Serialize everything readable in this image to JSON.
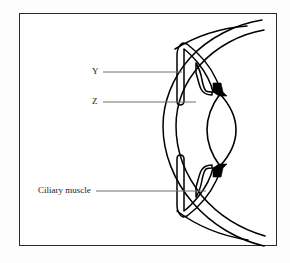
{
  "figure": {
    "type": "anatomical-diagram",
    "border_color": "#2a2a2a",
    "line_color": "#000000",
    "fill_color": "#000000",
    "background_color": "#ffffff"
  },
  "labels": {
    "y": "Y",
    "z": "Z",
    "ciliary_muscle": "Ciliary muscle"
  },
  "leader_lines": {
    "y": {
      "x1": 103,
      "y1": 72,
      "x2": 182,
      "y2": 72
    },
    "z": {
      "x1": 103,
      "y1": 102,
      "x2": 196,
      "y2": 102
    },
    "ciliary_muscle": {
      "x1": 96,
      "y1": 191,
      "x2": 206,
      "y2": 191
    }
  },
  "structures": [
    {
      "name": "sclera-outer-curve"
    },
    {
      "name": "sclera-inner-curve"
    },
    {
      "name": "cornea-outer-curve"
    },
    {
      "name": "cornea-inner-curve"
    },
    {
      "name": "iris-upper"
    },
    {
      "name": "iris-lower"
    },
    {
      "name": "ciliary-body-upper"
    },
    {
      "name": "ciliary-body-lower"
    },
    {
      "name": "lens"
    },
    {
      "name": "suspensory-attachment-upper"
    },
    {
      "name": "suspensory-attachment-lower"
    }
  ]
}
